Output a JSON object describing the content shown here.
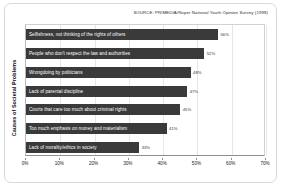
{
  "source_note": "SOURCE: PRIMEDIA/Roper National Youth Opinion Survey (1998)",
  "colors": {
    "bar": "#3a3a3a",
    "bar_text": "#ffffff",
    "value_text": "#333333",
    "grid": "#e6e6e6",
    "axis": "#8f8f8f",
    "frame": "#d8d8d8",
    "background": "#ffffff"
  },
  "chart_data": {
    "type": "bar",
    "orientation": "horizontal",
    "title": "",
    "subtitle": "",
    "xlabel": "",
    "ylabel": "Causes of Societal Problems",
    "xlim": [
      0,
      70
    ],
    "grid": true,
    "legend": "none",
    "tick_labels": [
      "0%",
      "10%",
      "20%",
      "30%",
      "40%",
      "50%",
      "60%",
      "70%"
    ],
    "tick_values": [
      0,
      10,
      20,
      30,
      40,
      50,
      60,
      70
    ],
    "categories": [
      "Selfishness, not thinking of the rights of others",
      "People who don't respect the law and authorities",
      "Wrongdoing by politicians",
      "Lack of parental discipline",
      "Courts that care too much about criminal rights",
      "Too much emphasis on money and materialism",
      "Lack of morality/ethics in society"
    ],
    "values": [
      56,
      52,
      48,
      47,
      45,
      41,
      33
    ],
    "value_labels": [
      "56%",
      "52%",
      "48%",
      "47%",
      "45%",
      "41%",
      "33%"
    ]
  }
}
